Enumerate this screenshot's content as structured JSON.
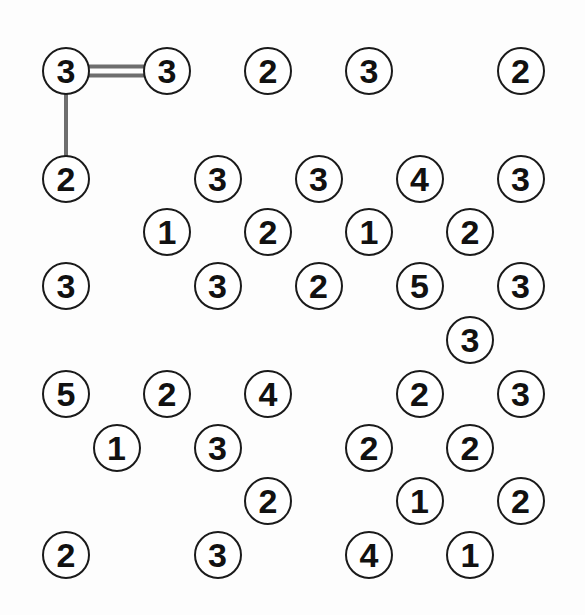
{
  "puzzle": {
    "type": "hashiwokakero",
    "title": "Hashiwokakero Bridges Puzzle",
    "grid": {
      "cols": 11,
      "rows": 11
    },
    "geometry": {
      "origin_x": 66,
      "origin_y": 71,
      "col_step": 50.5,
      "row_step": 53.8,
      "island_radius": 24
    },
    "colors": {
      "background": "#fdfdfd",
      "island_fill": "#ffffff",
      "island_stroke": "#1a1a1a",
      "number": "#111111",
      "bridge": "#6e6e6e"
    },
    "islands": [
      {
        "name": "island-r0c0",
        "value": "3",
        "row": 0,
        "col": 0
      },
      {
        "name": "island-r0c2",
        "value": "3",
        "row": 0,
        "col": 2
      },
      {
        "name": "island-r0c4",
        "value": "2",
        "row": 0,
        "col": 4
      },
      {
        "name": "island-r0c6",
        "value": "3",
        "row": 0,
        "col": 6
      },
      {
        "name": "island-r0c9",
        "value": "2",
        "row": 0,
        "col": 9
      },
      {
        "name": "island-r2c0",
        "value": "2",
        "row": 2,
        "col": 0
      },
      {
        "name": "island-r2c3",
        "value": "3",
        "row": 2,
        "col": 3
      },
      {
        "name": "island-r2c5",
        "value": "3",
        "row": 2,
        "col": 5
      },
      {
        "name": "island-r2c7",
        "value": "4",
        "row": 2,
        "col": 7
      },
      {
        "name": "island-r2c9",
        "value": "3",
        "row": 2,
        "col": 9
      },
      {
        "name": "island-r3c2",
        "value": "1",
        "row": 3,
        "col": 2
      },
      {
        "name": "island-r3c4",
        "value": "2",
        "row": 3,
        "col": 4
      },
      {
        "name": "island-r3c6",
        "value": "1",
        "row": 3,
        "col": 6
      },
      {
        "name": "island-r3c8",
        "value": "2",
        "row": 3,
        "col": 8
      },
      {
        "name": "island-r4c0",
        "value": "3",
        "row": 4,
        "col": 0
      },
      {
        "name": "island-r4c3",
        "value": "3",
        "row": 4,
        "col": 3
      },
      {
        "name": "island-r4c5",
        "value": "2",
        "row": 4,
        "col": 5
      },
      {
        "name": "island-r4c7",
        "value": "5",
        "row": 4,
        "col": 7
      },
      {
        "name": "island-r4c9",
        "value": "3",
        "row": 4,
        "col": 9
      },
      {
        "name": "island-r5c8",
        "value": "3",
        "row": 5,
        "col": 8
      },
      {
        "name": "island-r6c0",
        "value": "5",
        "row": 6,
        "col": 0
      },
      {
        "name": "island-r6c2",
        "value": "2",
        "row": 6,
        "col": 2
      },
      {
        "name": "island-r6c4",
        "value": "4",
        "row": 6,
        "col": 4
      },
      {
        "name": "island-r6c7",
        "value": "2",
        "row": 6,
        "col": 7
      },
      {
        "name": "island-r6c9",
        "value": "3",
        "row": 6,
        "col": 9
      },
      {
        "name": "island-r7c1",
        "value": "1",
        "row": 7,
        "col": 1
      },
      {
        "name": "island-r7c3",
        "value": "3",
        "row": 7,
        "col": 3
      },
      {
        "name": "island-r7c6",
        "value": "2",
        "row": 7,
        "col": 6
      },
      {
        "name": "island-r7c8",
        "value": "2",
        "row": 7,
        "col": 8
      },
      {
        "name": "island-r8c4",
        "value": "2",
        "row": 8,
        "col": 4
      },
      {
        "name": "island-r8c7",
        "value": "1",
        "row": 8,
        "col": 7
      },
      {
        "name": "island-r8c9",
        "value": "2",
        "row": 8,
        "col": 9
      },
      {
        "name": "island-r9c0",
        "value": "2",
        "row": 9,
        "col": 0
      },
      {
        "name": "island-r9c3",
        "value": "3",
        "row": 9,
        "col": 3
      },
      {
        "name": "island-r9c6",
        "value": "4",
        "row": 9,
        "col": 6
      },
      {
        "name": "island-r9c8",
        "value": "1",
        "row": 9,
        "col": 8
      }
    ],
    "bridges": [
      {
        "name": "bridge-r0c0-r0c2",
        "orientation": "horizontal",
        "count": 2,
        "from": {
          "row": 0,
          "col": 0
        },
        "to": {
          "row": 0,
          "col": 2
        }
      },
      {
        "name": "bridge-r0c0-r2c0",
        "orientation": "vertical",
        "count": 1,
        "from": {
          "row": 0,
          "col": 0
        },
        "to": {
          "row": 2,
          "col": 0
        }
      }
    ]
  }
}
